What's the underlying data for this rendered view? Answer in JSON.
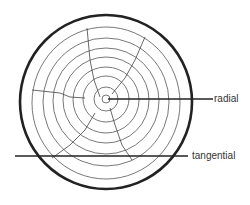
{
  "diagram": {
    "labels": {
      "radial": "radial",
      "tangential": "tangential"
    },
    "colors": {
      "stroke": "#222222",
      "ring": "#555555",
      "background": "#ffffff"
    }
  }
}
